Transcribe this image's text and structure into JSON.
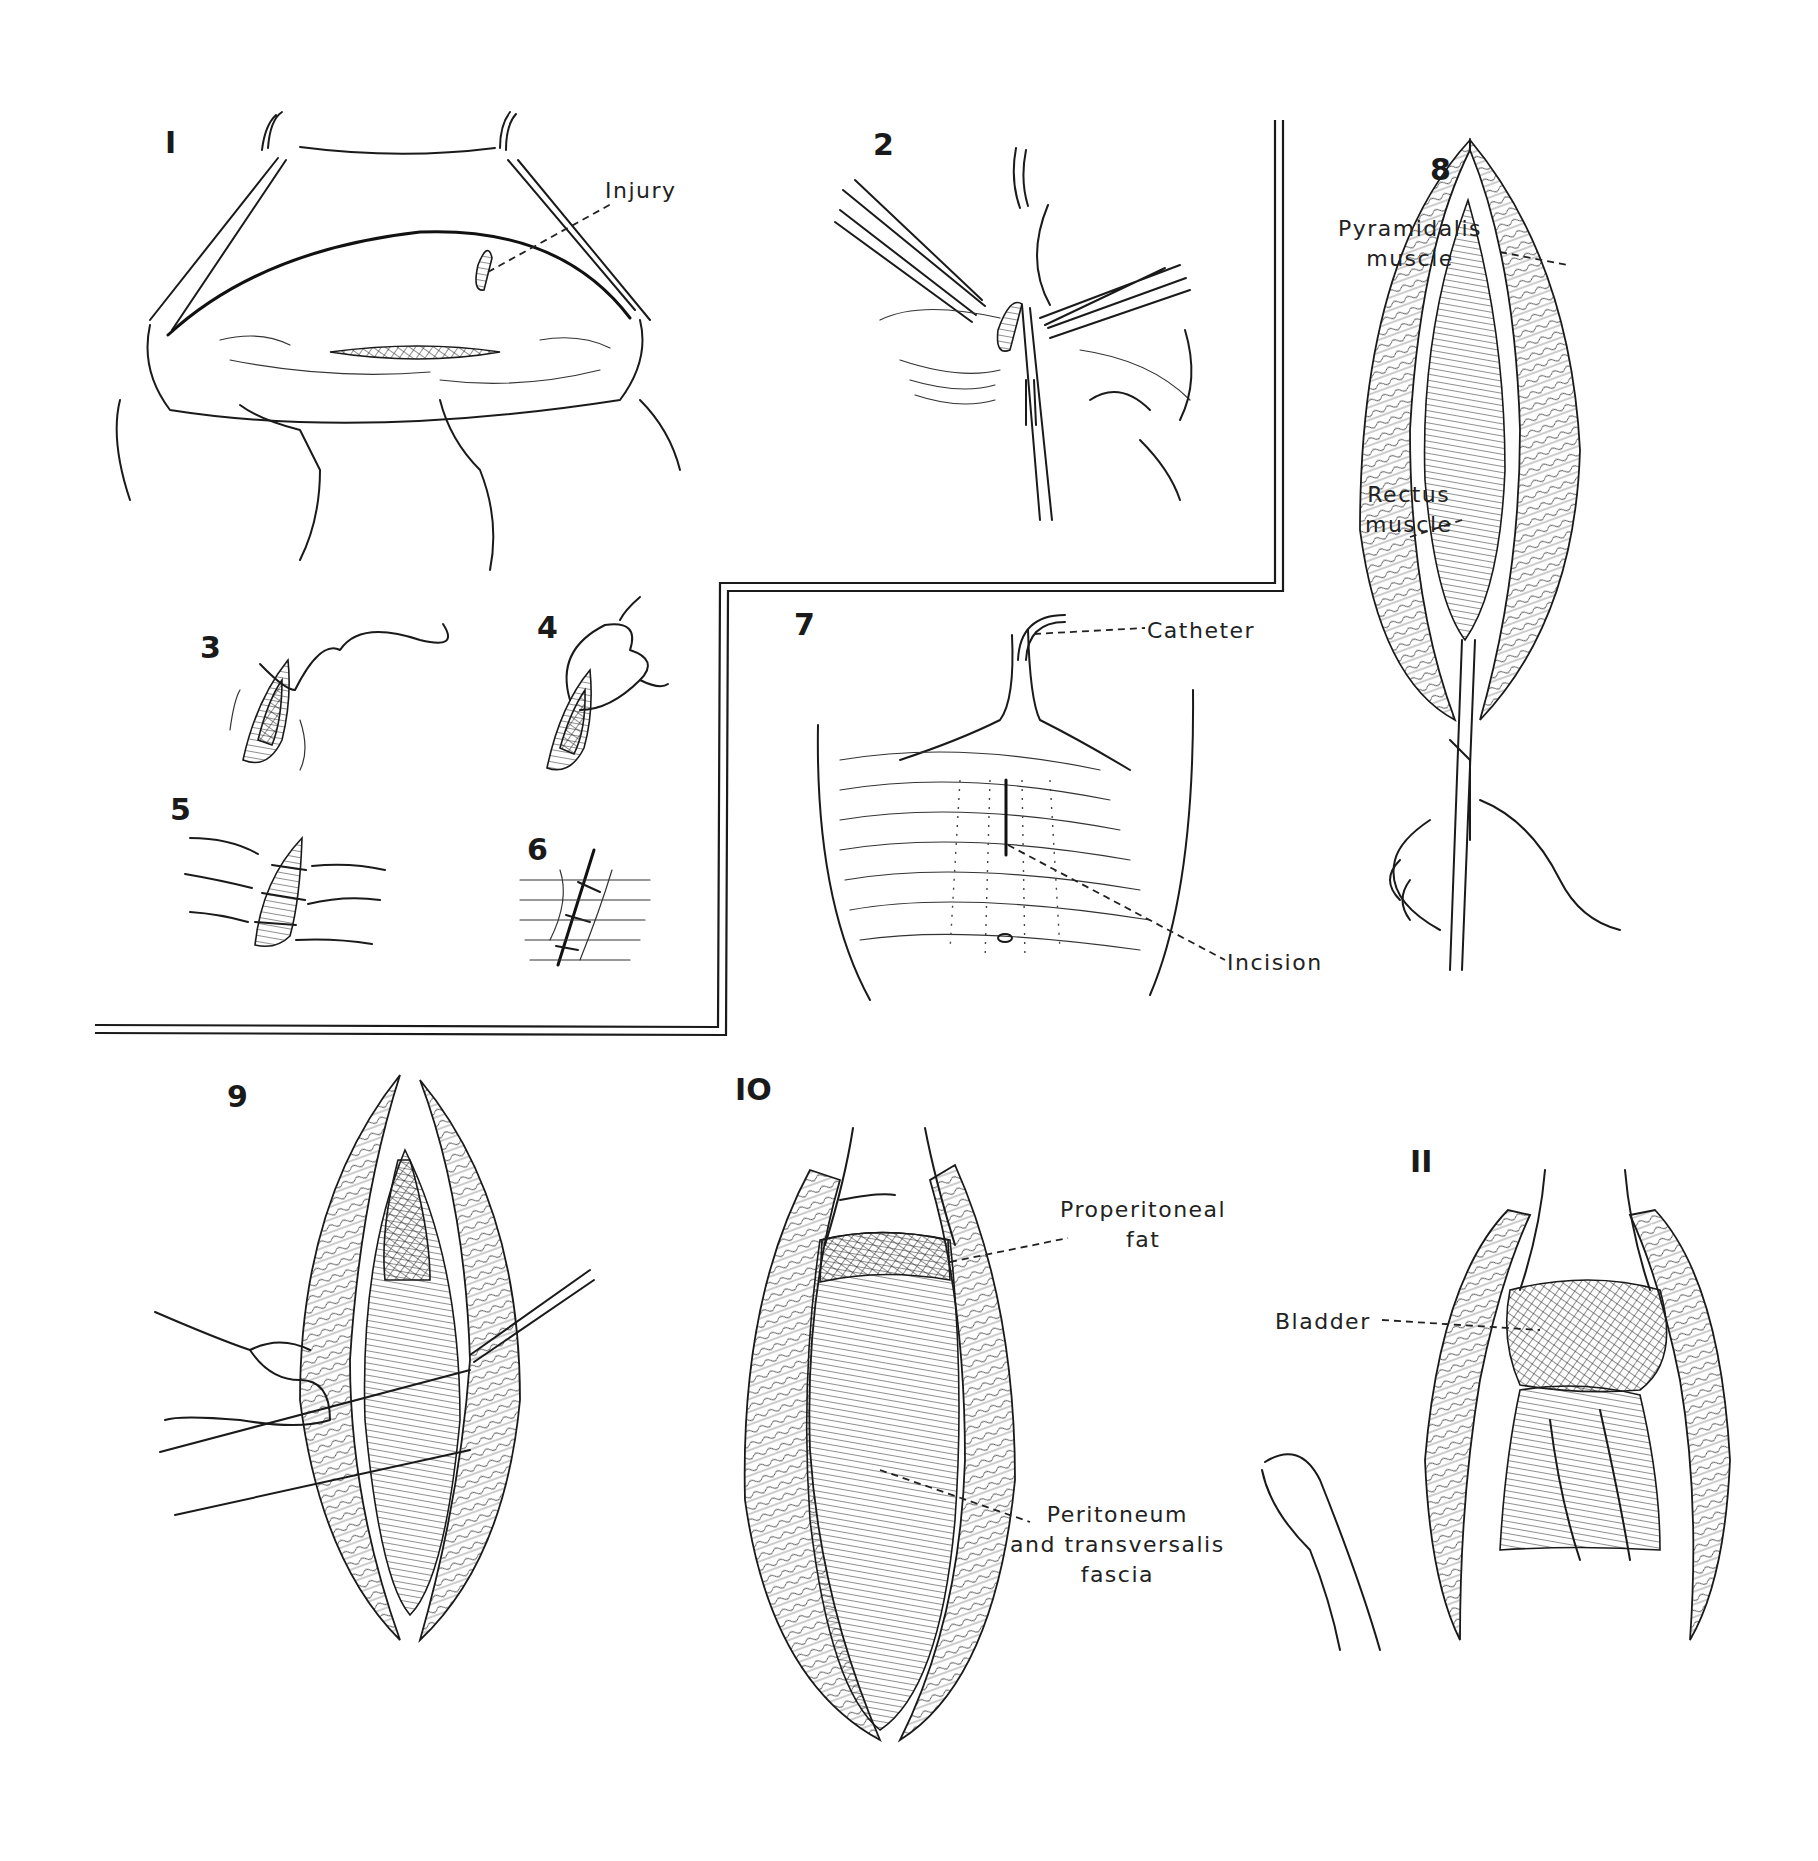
{
  "figure": {
    "panels": [
      {
        "id": "1",
        "number": "I",
        "labels": [
          {
            "text": "Injury"
          }
        ]
      },
      {
        "id": "2",
        "number": "2",
        "labels": []
      },
      {
        "id": "3",
        "number": "3",
        "labels": []
      },
      {
        "id": "4",
        "number": "4",
        "labels": []
      },
      {
        "id": "5",
        "number": "5",
        "labels": []
      },
      {
        "id": "6",
        "number": "6",
        "labels": []
      },
      {
        "id": "7",
        "number": "7",
        "labels": [
          {
            "text": "Catheter"
          },
          {
            "text": "Incision"
          }
        ]
      },
      {
        "id": "8",
        "number": "8",
        "labels": [
          {
            "text": "Pyramidalis\nmuscle"
          },
          {
            "text": "Rectus\nmuscle"
          }
        ]
      },
      {
        "id": "9",
        "number": "9",
        "labels": []
      },
      {
        "id": "10",
        "number": "IO",
        "labels": [
          {
            "text": "Properitoneal\nfat"
          },
          {
            "text": "Peritoneum\nand transversalis\nfascia"
          }
        ]
      },
      {
        "id": "11",
        "number": "II",
        "labels": [
          {
            "text": "Bladder"
          }
        ]
      }
    ]
  },
  "colors": {
    "ink": "#1a1a1a",
    "paper": "#ffffff"
  }
}
